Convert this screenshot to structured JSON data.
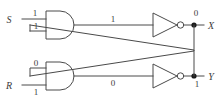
{
  "diagram": {
    "type": "logic-circuit",
    "colors": {
      "wire": "#4a4a4a",
      "text": "#3d3d3d",
      "junction": "#1a1a1a",
      "background": "#ffffff"
    },
    "inputs": [
      {
        "id": "S",
        "name": "set-input",
        "label": "S",
        "value": "1"
      },
      {
        "id": "R",
        "name": "reset-input",
        "label": "R",
        "value": "1"
      }
    ],
    "outputs": [
      {
        "id": "X",
        "name": "x-output",
        "label": "X",
        "value": "0"
      },
      {
        "id": "Y",
        "name": "y-output",
        "label": "Y",
        "value": "1"
      }
    ],
    "gates": [
      {
        "id": "and-top",
        "type": "AND",
        "name": "top-and-gate"
      },
      {
        "id": "and-bottom",
        "type": "AND",
        "name": "bottom-and-gate"
      },
      {
        "id": "not-top",
        "type": "NOT",
        "name": "top-not-gate"
      },
      {
        "id": "not-bottom",
        "type": "NOT",
        "name": "bottom-not-gate"
      }
    ],
    "signal_values": {
      "s_input": "1",
      "top_and_feedback_input": "1",
      "top_and_output": "1",
      "x_output": "0",
      "bottom_and_feedback_input": "0",
      "r_input": "1",
      "bottom_and_output": "0",
      "y_output": "1"
    }
  }
}
